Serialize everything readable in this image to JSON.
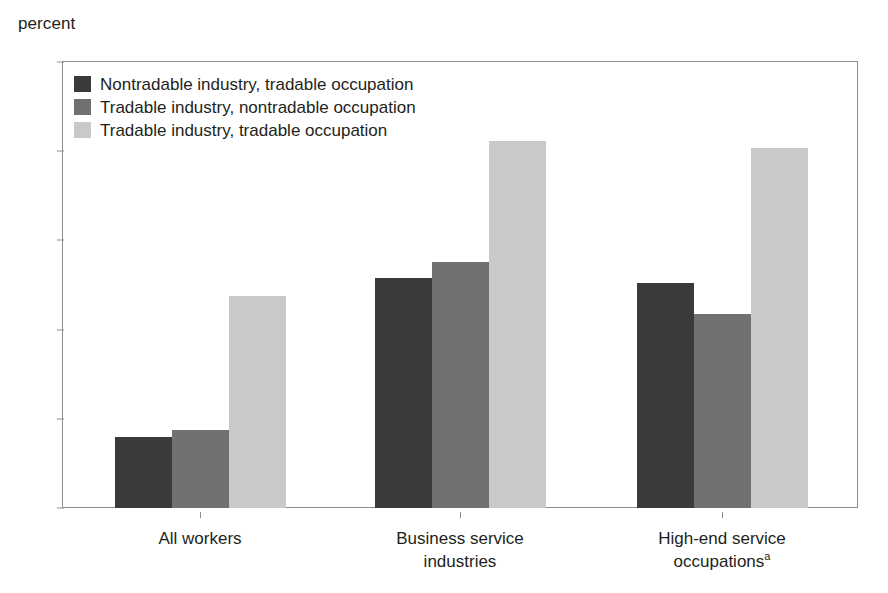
{
  "chart_data": {
    "type": "bar",
    "title": "",
    "subtitle": "",
    "xlabel": "",
    "ylabel": "percent",
    "ylim": [
      0,
      25
    ],
    "yticks": [
      0,
      5,
      10,
      15,
      20,
      25
    ],
    "grid": false,
    "legend_position": "top-left inside plot area",
    "categories": [
      "All workers",
      "Business service industries",
      "High-end service occupations"
    ],
    "category_labels": [
      {
        "line1": "All workers",
        "line2": "",
        "footnote": ""
      },
      {
        "line1": "Business service",
        "line2": "industries",
        "footnote": ""
      },
      {
        "line1": "High-end service",
        "line2": "occupations",
        "footnote": "a"
      }
    ],
    "series": [
      {
        "name": "Nontradable industry, tradable occupation",
        "color": "#3a3a3a",
        "values": [
          4.0,
          12.9,
          12.6
        ]
      },
      {
        "name": "Tradable industry, nontradable occupation",
        "color": "#717171",
        "values": [
          4.4,
          13.8,
          10.9
        ]
      },
      {
        "name": "Tradable industry, tradable occupation",
        "color": "#c9c9c9",
        "values": [
          11.9,
          20.6,
          20.2
        ]
      }
    ]
  },
  "axis": {
    "unit_label": "percent",
    "tick_labels": [
      "25",
      "20",
      "15",
      "10",
      "5",
      "0"
    ]
  },
  "colors": {
    "series_dark": "#3a3a3a",
    "series_medium": "#717171",
    "series_light": "#c9c9c9",
    "axis_line": "#8d8d8d",
    "text": "#231f20",
    "background": "#ffffff"
  }
}
